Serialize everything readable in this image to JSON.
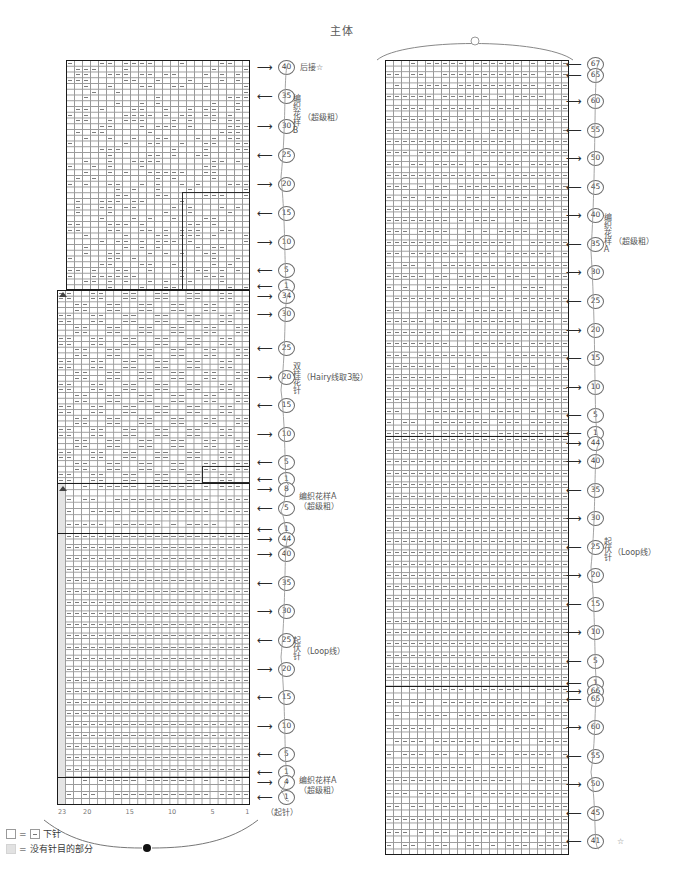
{
  "page": {
    "title": "主体"
  },
  "legend": {
    "items": [
      {
        "swatch": "empty-square",
        "eq": "=",
        "symbol_box": "stitch-dash",
        "label": "下针"
      },
      {
        "swatch": "grey-square",
        "eq": "=",
        "symbol_box": "",
        "label": "没有针目的部分"
      }
    ]
  },
  "left_chart": {
    "name": "body-front-chart",
    "stitch_axis": {
      "labels": [
        "23",
        "20",
        "15",
        "10",
        "5",
        "1"
      ],
      "positions_pct": [
        0.5,
        13.5,
        35.5,
        57.5,
        79.5,
        97.5
      ]
    },
    "bottom_note": "（起针）",
    "top_note": "后接☆",
    "sections": [
      {
        "id": "patternB",
        "label_vertical": "编织花样B",
        "label_side": "（超级粗）"
      },
      {
        "id": "doubleseed",
        "label_vertical": "双桂花针",
        "label_side": "（Hairy线取3股）"
      },
      {
        "id": "patternA1",
        "label_block": "编织花样A\n（超级粗）"
      },
      {
        "id": "garter",
        "label_vertical": "起伏针",
        "label_side": "（Loop线）"
      },
      {
        "id": "patternA2",
        "label_block": "编织花样A\n（超级粗）"
      }
    ],
    "row_markers": [
      {
        "num": "40",
        "dir": "right",
        "y": 67
      },
      {
        "num": "35",
        "dir": "left",
        "y": 96
      },
      {
        "num": "30",
        "dir": "right",
        "y": 126
      },
      {
        "num": "25",
        "dir": "left",
        "y": 155
      },
      {
        "num": "20",
        "dir": "right",
        "y": 184
      },
      {
        "num": "15",
        "dir": "left",
        "y": 213
      },
      {
        "num": "10",
        "dir": "right",
        "y": 242
      },
      {
        "num": "5",
        "dir": "left",
        "y": 270
      },
      {
        "num": "1",
        "dir": "left",
        "y": 286
      },
      {
        "num": "34",
        "dir": "right",
        "y": 296
      },
      {
        "num": "30",
        "dir": "right",
        "y": 314
      },
      {
        "num": "25",
        "dir": "left",
        "y": 348
      },
      {
        "num": "20",
        "dir": "right",
        "y": 377
      },
      {
        "num": "15",
        "dir": "left",
        "y": 405
      },
      {
        "num": "10",
        "dir": "right",
        "y": 434
      },
      {
        "num": "5",
        "dir": "left",
        "y": 462
      },
      {
        "num": "1",
        "dir": "left",
        "y": 479
      },
      {
        "num": "8",
        "dir": "right",
        "y": 489
      },
      {
        "num": "5",
        "dir": "left",
        "y": 508
      },
      {
        "num": "1",
        "dir": "left",
        "y": 529
      },
      {
        "num": "44",
        "dir": "right",
        "y": 539
      },
      {
        "num": "40",
        "dir": "right",
        "y": 554
      },
      {
        "num": "35",
        "dir": "left",
        "y": 583
      },
      {
        "num": "30",
        "dir": "right",
        "y": 611
      },
      {
        "num": "25",
        "dir": "left",
        "y": 640
      },
      {
        "num": "20",
        "dir": "right",
        "y": 669
      },
      {
        "num": "15",
        "dir": "left",
        "y": 697
      },
      {
        "num": "10",
        "dir": "right",
        "y": 726
      },
      {
        "num": "5",
        "dir": "left",
        "y": 754
      },
      {
        "num": "1",
        "dir": "left",
        "y": 772
      },
      {
        "num": "4",
        "dir": "right",
        "y": 782
      },
      {
        "num": "1",
        "dir": "left",
        "y": 797
      }
    ]
  },
  "right_chart": {
    "name": "body-back-chart",
    "bottom_marker": "☆",
    "sections": [
      {
        "id": "patternA-top",
        "label_vertical": "编织花样A",
        "label_side": "（超级粗）"
      },
      {
        "id": "garter",
        "label_vertical": "起伏针",
        "label_side": "（Loop线）"
      }
    ],
    "row_markers": [
      {
        "num": "67",
        "dir": "left",
        "y": 64
      },
      {
        "num": "65",
        "dir": "left",
        "y": 75
      },
      {
        "num": "60",
        "dir": "right",
        "y": 101
      },
      {
        "num": "55",
        "dir": "left",
        "y": 130
      },
      {
        "num": "50",
        "dir": "right",
        "y": 158
      },
      {
        "num": "45",
        "dir": "left",
        "y": 187
      },
      {
        "num": "40",
        "dir": "right",
        "y": 215
      },
      {
        "num": "35",
        "dir": "left",
        "y": 244
      },
      {
        "num": "30",
        "dir": "right",
        "y": 272
      },
      {
        "num": "25",
        "dir": "left",
        "y": 301
      },
      {
        "num": "20",
        "dir": "right",
        "y": 330
      },
      {
        "num": "15",
        "dir": "left",
        "y": 358
      },
      {
        "num": "10",
        "dir": "right",
        "y": 387
      },
      {
        "num": "5",
        "dir": "left",
        "y": 415
      },
      {
        "num": "1",
        "dir": "left",
        "y": 433
      },
      {
        "num": "44",
        "dir": "right",
        "y": 443
      },
      {
        "num": "40",
        "dir": "right",
        "y": 461
      },
      {
        "num": "35",
        "dir": "left",
        "y": 490
      },
      {
        "num": "30",
        "dir": "right",
        "y": 518
      },
      {
        "num": "25",
        "dir": "left",
        "y": 547
      },
      {
        "num": "20",
        "dir": "right",
        "y": 575
      },
      {
        "num": "15",
        "dir": "left",
        "y": 604
      },
      {
        "num": "10",
        "dir": "right",
        "y": 632
      },
      {
        "num": "5",
        "dir": "left",
        "y": 661
      },
      {
        "num": "1",
        "dir": "left",
        "y": 683
      },
      {
        "num": "66",
        "dir": "right",
        "y": 691
      },
      {
        "num": "65",
        "dir": "left",
        "y": 699
      },
      {
        "num": "60",
        "dir": "right",
        "y": 727
      },
      {
        "num": "55",
        "dir": "left",
        "y": 756
      },
      {
        "num": "50",
        "dir": "right",
        "y": 784
      },
      {
        "num": "45",
        "dir": "left",
        "y": 813
      },
      {
        "num": "41",
        "dir": "left",
        "y": 841
      }
    ]
  },
  "chart_data": {
    "type": "table",
    "title": "主体",
    "left_panel": {
      "columns": 23,
      "column_labels": [
        "23",
        "20",
        "15",
        "10",
        "5",
        "1"
      ],
      "total_rows": 126,
      "sections_bottom_to_top": [
        {
          "name": "编织花样A（超级粗）",
          "rows": "1-4",
          "row_count": 4
        },
        {
          "name": "起伏针（Loop线）",
          "rows": "1-44",
          "row_count": 44
        },
        {
          "name": "编织花样A（超级粗）",
          "rows": "1-8",
          "row_count": 8
        },
        {
          "name": "双桂花针（Hairy线取3股）",
          "rows": "1-34",
          "row_count": 34
        },
        {
          "name": "编织花样B（超级粗）",
          "rows": "1-40",
          "row_count": 40
        }
      ]
    },
    "right_panel": {
      "columns": 23,
      "sections_bottom_to_top": [
        {
          "name": "编织花样A（超级粗）",
          "rows": "41-66",
          "row_count": 26
        },
        {
          "name": "起伏针（Loop线）",
          "rows": "1-44",
          "row_count": 44
        },
        {
          "name": "编织花样A（超级粗）",
          "rows": "1-67",
          "row_count": 67
        }
      ]
    },
    "direction_legend": {
      "right_arrow": "knit on right side (odd rows)",
      "left_arrow": "knit on wrong side (even rows)"
    }
  }
}
